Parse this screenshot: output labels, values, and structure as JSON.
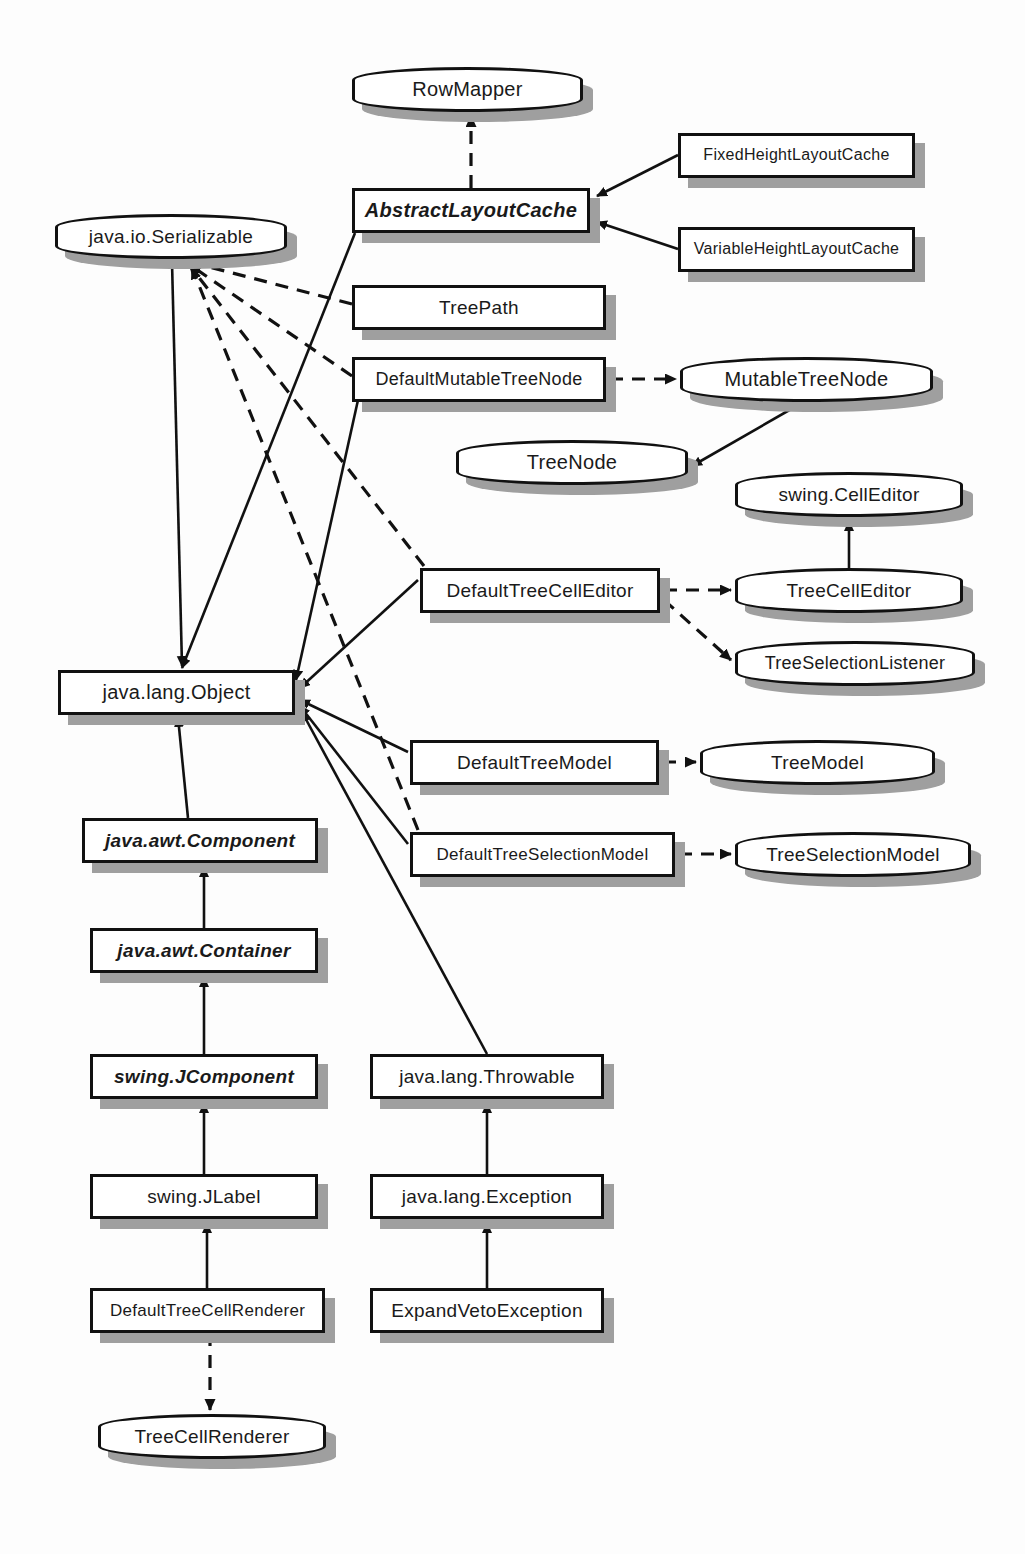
{
  "diagram": {
    "type": "uml-class-diagram",
    "colors": {
      "background": "#fdfdfd",
      "node_fill": "#ffffff",
      "node_stroke": "#111111",
      "shadow": "#9f9f9f",
      "edge": "#111111"
    },
    "legend": {
      "solid_arrow": "generalization (extends)",
      "dashed_arrow": "realization (implements)",
      "rounded_box": "interface",
      "rectangle": "class",
      "italic_label": "abstract"
    }
  },
  "nodes": [
    {
      "id": "RowMapper",
      "label": "RowMapper",
      "kind": "interface",
      "abstract": false,
      "x": 352,
      "y": 67,
      "w": 231,
      "h": 45,
      "fs": 20
    },
    {
      "id": "AbstractLayoutCache",
      "label": "AbstractLayoutCache",
      "kind": "class",
      "abstract": true,
      "x": 352,
      "y": 188,
      "w": 238,
      "h": 45,
      "fs": 20
    },
    {
      "id": "FixedHeightLayoutCache",
      "label": "FixedHeightLayoutCache",
      "kind": "class",
      "abstract": false,
      "x": 678,
      "y": 133,
      "w": 237,
      "h": 45,
      "fs": 16
    },
    {
      "id": "VariableHeightLayoutCache",
      "label": "VariableHeightLayoutCache",
      "kind": "class",
      "abstract": false,
      "x": 678,
      "y": 227,
      "w": 237,
      "h": 45,
      "fs": 16
    },
    {
      "id": "Serializable",
      "label": "java.io.Serializable",
      "kind": "interface",
      "abstract": false,
      "x": 55,
      "y": 214,
      "w": 232,
      "h": 45,
      "fs": 19
    },
    {
      "id": "TreePath",
      "label": "TreePath",
      "kind": "class",
      "abstract": false,
      "x": 352,
      "y": 285,
      "w": 254,
      "h": 45,
      "fs": 19
    },
    {
      "id": "DefaultMutableTreeNode",
      "label": "DefaultMutableTreeNode",
      "kind": "class",
      "abstract": false,
      "x": 352,
      "y": 357,
      "w": 254,
      "h": 45,
      "fs": 18
    },
    {
      "id": "MutableTreeNode",
      "label": "MutableTreeNode",
      "kind": "interface",
      "abstract": false,
      "x": 680,
      "y": 357,
      "w": 253,
      "h": 45,
      "fs": 20
    },
    {
      "id": "TreeNode",
      "label": "TreeNode",
      "kind": "interface",
      "abstract": false,
      "x": 456,
      "y": 440,
      "w": 232,
      "h": 45,
      "fs": 20
    },
    {
      "id": "CellEditor",
      "label": "swing.CellEditor",
      "kind": "interface",
      "abstract": false,
      "x": 735,
      "y": 472,
      "w": 228,
      "h": 45,
      "fs": 19
    },
    {
      "id": "DefaultTreeCellEditor",
      "label": "DefaultTreeCellEditor",
      "kind": "class",
      "abstract": false,
      "x": 420,
      "y": 568,
      "w": 240,
      "h": 45,
      "fs": 19
    },
    {
      "id": "TreeCellEditor",
      "label": "TreeCellEditor",
      "kind": "interface",
      "abstract": false,
      "x": 735,
      "y": 568,
      "w": 228,
      "h": 45,
      "fs": 19
    },
    {
      "id": "TreeSelectionListener",
      "label": "TreeSelectionListener",
      "kind": "interface",
      "abstract": false,
      "x": 735,
      "y": 641,
      "w": 240,
      "h": 45,
      "fs": 18
    },
    {
      "id": "Object",
      "label": "java.lang.Object",
      "kind": "class",
      "abstract": false,
      "x": 58,
      "y": 670,
      "w": 237,
      "h": 45,
      "fs": 20
    },
    {
      "id": "DefaultTreeModel",
      "label": "DefaultTreeModel",
      "kind": "class",
      "abstract": false,
      "x": 410,
      "y": 740,
      "w": 249,
      "h": 45,
      "fs": 19
    },
    {
      "id": "TreeModel",
      "label": "TreeModel",
      "kind": "interface",
      "abstract": false,
      "x": 700,
      "y": 740,
      "w": 235,
      "h": 45,
      "fs": 19
    },
    {
      "id": "DefaultTreeSelectionModel",
      "label": "DefaultTreeSelectionModel",
      "kind": "class",
      "abstract": false,
      "x": 410,
      "y": 832,
      "w": 265,
      "h": 45,
      "fs": 17
    },
    {
      "id": "TreeSelectionModel",
      "label": "TreeSelectionModel",
      "kind": "interface",
      "abstract": false,
      "x": 735,
      "y": 832,
      "w": 236,
      "h": 45,
      "fs": 19
    },
    {
      "id": "Component",
      "label": "java.awt.Component",
      "kind": "class",
      "abstract": true,
      "x": 82,
      "y": 818,
      "w": 236,
      "h": 45,
      "fs": 19
    },
    {
      "id": "Container",
      "label": "java.awt.Container",
      "kind": "class",
      "abstract": true,
      "x": 90,
      "y": 928,
      "w": 228,
      "h": 45,
      "fs": 19
    },
    {
      "id": "JComponent",
      "label": "swing.JComponent",
      "kind": "class",
      "abstract": true,
      "x": 90,
      "y": 1054,
      "w": 228,
      "h": 45,
      "fs": 19
    },
    {
      "id": "JLabel",
      "label": "swing.JLabel",
      "kind": "class",
      "abstract": false,
      "x": 90,
      "y": 1174,
      "w": 228,
      "h": 45,
      "fs": 19
    },
    {
      "id": "DefaultTreeCellRenderer",
      "label": "DefaultTreeCellRenderer",
      "kind": "class",
      "abstract": false,
      "x": 90,
      "y": 1288,
      "w": 235,
      "h": 45,
      "fs": 17
    },
    {
      "id": "TreeCellRenderer",
      "label": "TreeCellRenderer",
      "kind": "interface",
      "abstract": false,
      "x": 98,
      "y": 1414,
      "w": 228,
      "h": 45,
      "fs": 19
    },
    {
      "id": "Throwable",
      "label": "java.lang.Throwable",
      "kind": "class",
      "abstract": false,
      "x": 370,
      "y": 1054,
      "w": 234,
      "h": 45,
      "fs": 19
    },
    {
      "id": "Exception",
      "label": "java.lang.Exception",
      "kind": "class",
      "abstract": false,
      "x": 370,
      "y": 1174,
      "w": 234,
      "h": 45,
      "fs": 19
    },
    {
      "id": "ExpandVetoException",
      "label": "ExpandVetoException",
      "kind": "class",
      "abstract": false,
      "x": 370,
      "y": 1288,
      "w": 234,
      "h": 45,
      "fs": 19
    }
  ],
  "edges": [
    {
      "from": "AbstractLayoutCache",
      "to": "RowMapper",
      "style": "dashed",
      "points": "471,188 471,116"
    },
    {
      "from": "FixedHeightLayoutCache",
      "to": "AbstractLayoutCache",
      "style": "solid",
      "points": "678,155 597,196"
    },
    {
      "from": "VariableHeightLayoutCache",
      "to": "AbstractLayoutCache",
      "style": "solid",
      "points": "678,249 597,222"
    },
    {
      "from": "AbstractLayoutCache",
      "to": "Object",
      "style": "solid",
      "points": "355,233 182,668"
    },
    {
      "from": "TreePath",
      "to": "Serializable",
      "style": "dashed",
      "points": "352,304 190,262"
    },
    {
      "from": "DefaultMutableTreeNode",
      "to": "Serializable",
      "style": "dashed",
      "points": "352,376 190,265"
    },
    {
      "from": "DefaultMutableTreeNode",
      "to": "Object",
      "style": "solid",
      "points": "358,400 296,680"
    },
    {
      "from": "DefaultMutableTreeNode",
      "to": "MutableTreeNode",
      "style": "dashed",
      "points": "610,379 676,379"
    },
    {
      "from": "MutableTreeNode",
      "to": "TreeNode",
      "style": "solid",
      "points": "800,404 692,466"
    },
    {
      "from": "DefaultTreeCellEditor",
      "to": "TreeCellEditor",
      "style": "dashed",
      "points": "664,590 731,590"
    },
    {
      "from": "DefaultTreeCellEditor",
      "to": "TreeSelectionListener",
      "style": "dashed",
      "points": "664,600 731,660"
    },
    {
      "from": "TreeCellEditor",
      "to": "CellEditor",
      "style": "solid",
      "points": "849,568 849,521"
    },
    {
      "from": "DefaultTreeCellEditor",
      "to": "Object",
      "style": "solid",
      "points": "418,580 300,688"
    },
    {
      "from": "DefaultTreeModel",
      "to": "Object",
      "style": "solid",
      "points": "408,752 300,700"
    },
    {
      "from": "DefaultTreeModel",
      "to": "TreeModel",
      "style": "dashed",
      "points": "663,762 696,762"
    },
    {
      "from": "DefaultTreeSelectionModel",
      "to": "Object",
      "style": "solid",
      "points": "408,844 300,706"
    },
    {
      "from": "DefaultTreeSelectionModel",
      "to": "TreeSelectionModel",
      "style": "dashed",
      "points": "679,854 731,854"
    },
    {
      "from": "DefaultTreeSelectionModel",
      "to": "Serializable",
      "style": "dashed",
      "points": "418,830 192,268"
    },
    {
      "from": "DefaultTreeCellEditor",
      "to": "Serializable",
      "style": "dashed",
      "points": "424,566 190,266"
    },
    {
      "from": "Serializable",
      "to": "Object",
      "style": "solid",
      "points": "172,262 182,666"
    },
    {
      "from": "Component",
      "to": "Object",
      "style": "solid",
      "points": "188,818 178,717"
    },
    {
      "from": "Container",
      "to": "Component",
      "style": "solid",
      "points": "204,928 204,867"
    },
    {
      "from": "JComponent",
      "to": "Container",
      "style": "solid",
      "points": "204,1054 204,977"
    },
    {
      "from": "JLabel",
      "to": "JComponent",
      "style": "solid",
      "points": "204,1174 204,1103"
    },
    {
      "from": "DefaultTreeCellRenderer",
      "to": "JLabel",
      "style": "solid",
      "points": "207,1288 207,1223"
    },
    {
      "from": "DefaultTreeCellRenderer",
      "to": "TreeCellRenderer",
      "style": "dashed",
      "points": "210,1333 210,1410"
    },
    {
      "from": "Throwable",
      "to": "Object",
      "style": "solid",
      "points": "487,1054 302,712"
    },
    {
      "from": "Exception",
      "to": "Throwable",
      "style": "solid",
      "points": "487,1174 487,1103"
    },
    {
      "from": "ExpandVetoException",
      "to": "Exception",
      "style": "solid",
      "points": "487,1288 487,1223"
    }
  ]
}
